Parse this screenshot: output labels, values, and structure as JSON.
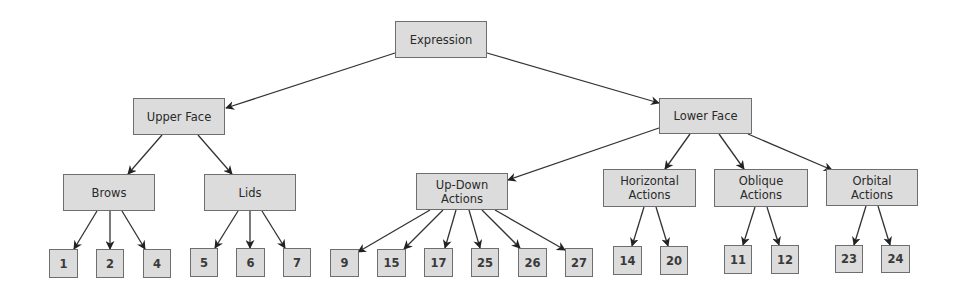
{
  "diagram": {
    "title": "Expression",
    "colors": {
      "node_fill": "#dcdcdc",
      "node_border": "#6e6e6e",
      "edge": "#333333",
      "text": "#2a2a2a"
    },
    "nodes": {
      "expression": {
        "label": "Expression",
        "x": 395,
        "y": 21,
        "w": 92,
        "h": 37
      },
      "upper_face": {
        "label": "Upper Face",
        "x": 133,
        "y": 98,
        "w": 92,
        "h": 37
      },
      "lower_face": {
        "label": "Lower Face",
        "x": 659,
        "y": 98,
        "w": 93,
        "h": 36
      },
      "brows": {
        "label": "Brows",
        "x": 63,
        "y": 174,
        "w": 92,
        "h": 37
      },
      "lids": {
        "label": "Lids",
        "x": 204,
        "y": 174,
        "w": 92,
        "h": 37
      },
      "up_down": {
        "label": "Up-Down Actions",
        "x": 416,
        "y": 173,
        "w": 92,
        "h": 37
      },
      "horizontal": {
        "label": "Horizontal Actions",
        "x": 603,
        "y": 169,
        "w": 93,
        "h": 38
      },
      "oblique": {
        "label": "Oblique Actions",
        "x": 714,
        "y": 169,
        "w": 94,
        "h": 38
      },
      "orbital": {
        "label": "Orbital Actions",
        "x": 826,
        "y": 169,
        "w": 92,
        "h": 37
      },
      "au1": {
        "label": "1",
        "x": 49,
        "y": 249,
        "w": 29,
        "h": 29
      },
      "au2": {
        "label": "2",
        "x": 96,
        "y": 249,
        "w": 28,
        "h": 29
      },
      "au4": {
        "label": "4",
        "x": 143,
        "y": 249,
        "w": 28,
        "h": 29
      },
      "au5": {
        "label": "5",
        "x": 190,
        "y": 248,
        "w": 28,
        "h": 29
      },
      "au6": {
        "label": "6",
        "x": 236,
        "y": 248,
        "w": 29,
        "h": 29
      },
      "au7": {
        "label": "7",
        "x": 283,
        "y": 248,
        "w": 28,
        "h": 29
      },
      "au9": {
        "label": "9",
        "x": 330,
        "y": 249,
        "w": 29,
        "h": 28
      },
      "au15": {
        "label": "15",
        "x": 377,
        "y": 249,
        "w": 29,
        "h": 28
      },
      "au17": {
        "label": "17",
        "x": 424,
        "y": 248,
        "w": 29,
        "h": 29
      },
      "au25": {
        "label": "25",
        "x": 471,
        "y": 248,
        "w": 28,
        "h": 29
      },
      "au26": {
        "label": "26",
        "x": 518,
        "y": 248,
        "w": 29,
        "h": 29
      },
      "au27": {
        "label": "27",
        "x": 565,
        "y": 248,
        "w": 28,
        "h": 29
      },
      "au14": {
        "label": "14",
        "x": 613,
        "y": 246,
        "w": 29,
        "h": 29
      },
      "au20": {
        "label": "20",
        "x": 660,
        "y": 246,
        "w": 28,
        "h": 29
      },
      "au11": {
        "label": "11",
        "x": 724,
        "y": 245,
        "w": 28,
        "h": 29
      },
      "au12": {
        "label": "12",
        "x": 771,
        "y": 245,
        "w": 28,
        "h": 29
      },
      "au23": {
        "label": "23",
        "x": 835,
        "y": 245,
        "w": 28,
        "h": 28
      },
      "au24": {
        "label": "24",
        "x": 881,
        "y": 245,
        "w": 29,
        "h": 28
      }
    },
    "edges": [
      {
        "from": "expression",
        "to": "upper_face",
        "x1": 395,
        "y1": 53,
        "x2": 226,
        "y2": 108
      },
      {
        "from": "expression",
        "to": "lower_face",
        "x1": 487,
        "y1": 53,
        "x2": 659,
        "y2": 103
      },
      {
        "from": "upper_face",
        "to": "brows",
        "x1": 162,
        "y1": 135,
        "x2": 128,
        "y2": 174
      },
      {
        "from": "upper_face",
        "to": "lids",
        "x1": 198,
        "y1": 135,
        "x2": 232,
        "y2": 174
      },
      {
        "from": "lower_face",
        "to": "up_down",
        "x1": 659,
        "y1": 128,
        "x2": 508,
        "y2": 180
      },
      {
        "from": "lower_face",
        "to": "horizontal",
        "x1": 690,
        "y1": 134,
        "x2": 665,
        "y2": 169
      },
      {
        "from": "lower_face",
        "to": "oblique",
        "x1": 719,
        "y1": 134,
        "x2": 744,
        "y2": 169
      },
      {
        "from": "lower_face",
        "to": "orbital",
        "x1": 748,
        "y1": 134,
        "x2": 832,
        "y2": 170
      },
      {
        "from": "brows",
        "to": "au1",
        "x1": 97,
        "y1": 211,
        "x2": 74,
        "y2": 249
      },
      {
        "from": "brows",
        "to": "au2",
        "x1": 110,
        "y1": 211,
        "x2": 110,
        "y2": 249
      },
      {
        "from": "brows",
        "to": "au4",
        "x1": 122,
        "y1": 211,
        "x2": 145,
        "y2": 249
      },
      {
        "from": "lids",
        "to": "au5",
        "x1": 238,
        "y1": 211,
        "x2": 215,
        "y2": 248
      },
      {
        "from": "lids",
        "to": "au6",
        "x1": 250,
        "y1": 211,
        "x2": 250,
        "y2": 248
      },
      {
        "from": "lids",
        "to": "au7",
        "x1": 262,
        "y1": 211,
        "x2": 285,
        "y2": 248
      },
      {
        "from": "up_down",
        "to": "au9",
        "x1": 430,
        "y1": 210,
        "x2": 358,
        "y2": 252
      },
      {
        "from": "up_down",
        "to": "au15",
        "x1": 443,
        "y1": 210,
        "x2": 404,
        "y2": 249
      },
      {
        "from": "up_down",
        "to": "au17",
        "x1": 456,
        "y1": 210,
        "x2": 445,
        "y2": 248
      },
      {
        "from": "up_down",
        "to": "au25",
        "x1": 469,
        "y1": 210,
        "x2": 480,
        "y2": 248
      },
      {
        "from": "up_down",
        "to": "au26",
        "x1": 482,
        "y1": 210,
        "x2": 520,
        "y2": 248
      },
      {
        "from": "up_down",
        "to": "au27",
        "x1": 495,
        "y1": 210,
        "x2": 565,
        "y2": 250
      },
      {
        "from": "horizontal",
        "to": "au14",
        "x1": 644,
        "y1": 207,
        "x2": 632,
        "y2": 246
      },
      {
        "from": "horizontal",
        "to": "au20",
        "x1": 656,
        "y1": 207,
        "x2": 668,
        "y2": 246
      },
      {
        "from": "oblique",
        "to": "au11",
        "x1": 755,
        "y1": 207,
        "x2": 743,
        "y2": 245
      },
      {
        "from": "oblique",
        "to": "au12",
        "x1": 767,
        "y1": 207,
        "x2": 779,
        "y2": 245
      },
      {
        "from": "orbital",
        "to": "au23",
        "x1": 866,
        "y1": 206,
        "x2": 854,
        "y2": 245
      },
      {
        "from": "orbital",
        "to": "au24",
        "x1": 878,
        "y1": 206,
        "x2": 890,
        "y2": 245
      }
    ]
  }
}
